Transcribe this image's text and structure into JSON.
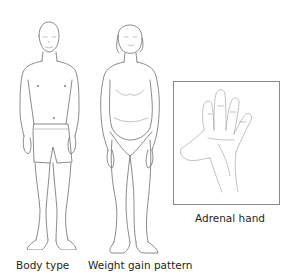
{
  "figure": {
    "panels": [
      {
        "id": "body-type",
        "label": "Body type",
        "depicts": "male-figure-outline"
      },
      {
        "id": "weight-gain-pattern",
        "label": "Weight gain pattern",
        "depicts": "female-figure-outline"
      },
      {
        "id": "adrenal-hand",
        "label": "Adrenal hand",
        "depicts": "hand-palm-outline-in-box"
      }
    ]
  },
  "colors": {
    "line": "#6d6d6d",
    "text": "#231f20",
    "background": "#ffffff"
  }
}
